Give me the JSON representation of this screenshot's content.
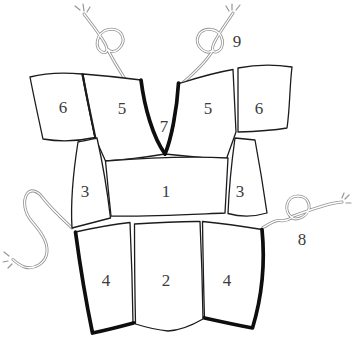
{
  "diagram": {
    "labels": {
      "panel_6_left": "6",
      "panel_5_left": "5",
      "panel_7": "7",
      "panel_5_right": "5",
      "panel_6_right": "6",
      "panel_3_left": "3",
      "panel_1": "1",
      "panel_3_right": "3",
      "panel_4_left": "4",
      "panel_2": "2",
      "panel_4_right": "4",
      "cord_8": "8",
      "cord_9": "9"
    },
    "colors": {
      "background": "#ffffff",
      "outline": "#1c1c1c",
      "thick_edge": "#0e0e0e",
      "cord": "#969696",
      "cord_core": "#ffffff",
      "label_text": "#3c3c3c"
    }
  }
}
